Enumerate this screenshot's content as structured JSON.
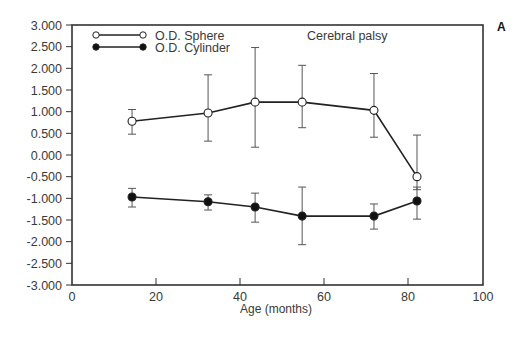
{
  "chart_data": {
    "type": "line",
    "title": "Cerebral palsy",
    "panel_label": "A",
    "xlabel": "Age (months)",
    "ylabel": "",
    "xlim": [
      0,
      100
    ],
    "ylim": [
      -3,
      3
    ],
    "x_ticks": [
      0,
      20,
      40,
      60,
      80,
      100
    ],
    "x_tick_labels": [
      "0",
      "20",
      "40",
      "60",
      "80",
      "100"
    ],
    "y_ticks": [
      3,
      2.5,
      2,
      1.5,
      1,
      0.5,
      0,
      -0.5,
      -1,
      -1.5,
      -2,
      -2.5,
      -3
    ],
    "y_tick_labels": [
      "3.000",
      "2.500",
      "2.000",
      "1.500",
      "1.000",
      "0.500",
      "0.000",
      "-0.500",
      "-1.000",
      "-1.500",
      "-2.000",
      "-2.500",
      "-3.000"
    ],
    "grid": false,
    "legend_position": "upper-left",
    "series": [
      {
        "name": "O.D. Sphere",
        "marker": "open-circle",
        "x": [
          14.3,
          32.4,
          43.6,
          54.8,
          71.9,
          82.4
        ],
        "values": [
          0.78,
          0.97,
          1.22,
          1.22,
          1.03,
          -0.5
        ],
        "error_upper": [
          1.05,
          1.85,
          2.48,
          2.07,
          1.88,
          0.46
        ],
        "error_lower": [
          0.48,
          0.32,
          0.18,
          0.63,
          0.41,
          -0.8
        ]
      },
      {
        "name": "O.D. Cylinder",
        "marker": "filled-circle",
        "x": [
          14.3,
          32.4,
          43.6,
          54.8,
          71.9,
          82.4
        ],
        "values": [
          -0.97,
          -1.08,
          -1.2,
          -1.41,
          -1.41,
          -1.06
        ],
        "error_upper": [
          -0.77,
          -0.92,
          -0.88,
          -0.74,
          -1.13,
          -0.74
        ],
        "error_lower": [
          -1.2,
          -1.27,
          -1.55,
          -2.07,
          -1.71,
          -1.48
        ]
      }
    ]
  }
}
